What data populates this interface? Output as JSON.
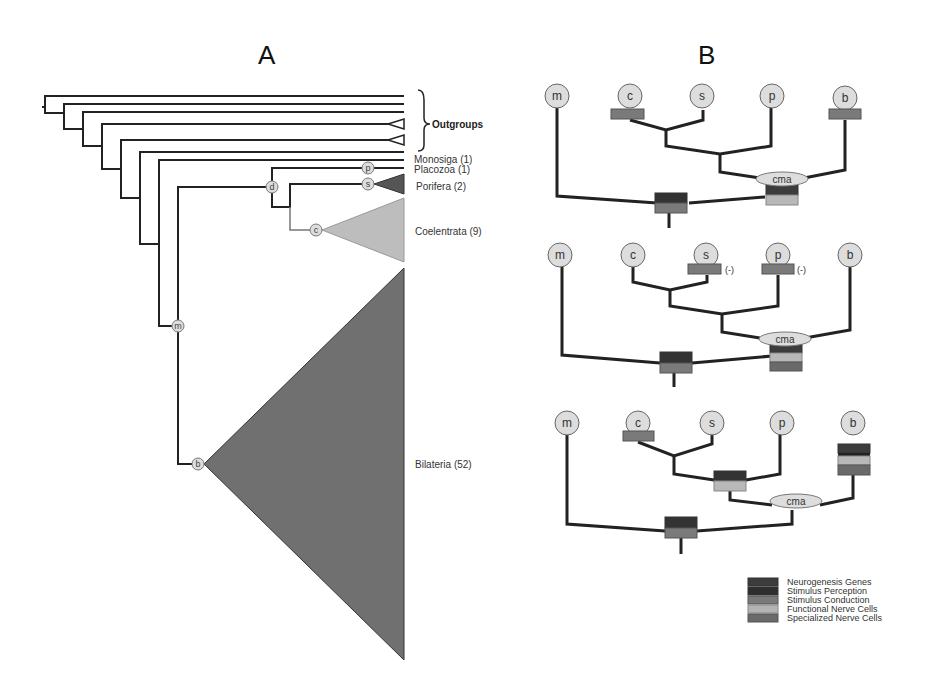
{
  "panels": {
    "a": {
      "title": "A"
    },
    "b": {
      "title": "B"
    }
  },
  "tree_a": {
    "outgroups_label": "Outgroups",
    "taxa": [
      {
        "name": "Monosiga (1)"
      },
      {
        "name": "Placozoa (1)"
      },
      {
        "name": "Porifera (2)"
      },
      {
        "name": "Coelentrata (9)"
      },
      {
        "name": "Bilateria (52)"
      }
    ],
    "nodes": {
      "p": "p",
      "s": "s",
      "d": "d",
      "c": "c",
      "m": "m",
      "b": "b"
    }
  },
  "scenarios": {
    "tips": [
      "m",
      "c",
      "s",
      "p",
      "b"
    ],
    "cma_label": "cma",
    "minus_label": "(-)"
  },
  "legend": {
    "items": [
      {
        "label": "Neurogenesis Genes",
        "color": "#3c3c3c"
      },
      {
        "label": "Stimulus Perception",
        "color": "#2e2e2e"
      },
      {
        "label": "Stimulus Conduction",
        "color": "#7a7a7a"
      },
      {
        "label": "Functional Nerve Cells",
        "color": "#b4b4b4"
      },
      {
        "label": "Specialized Nerve Cells",
        "color": "#6a6a6a"
      }
    ]
  },
  "colors": {
    "line": "#222222",
    "bilateria": "#707070",
    "coelentrata": "#bdbdbd",
    "porifera": "#555555",
    "node_fill": "#dcdcdc",
    "dark_box": "#333333",
    "mid_box": "#7a7a7a",
    "light_box": "#b8b8b8"
  }
}
